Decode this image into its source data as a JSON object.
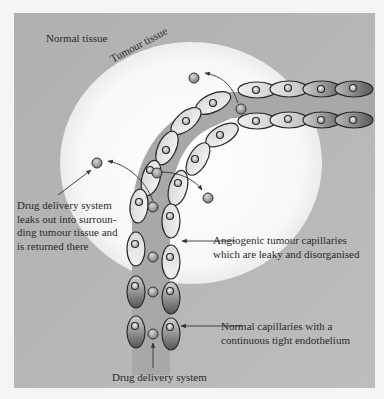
{
  "diagram": {
    "colors": {
      "page_background": "#f4f4f4",
      "normal_tissue": "#b3b3b3",
      "tumour_tissue": "#fafafa",
      "vessel_lumen": "#a9a9a9",
      "cell_outline": "#2b2b2b",
      "cell_fill_light": "#e6e6e6",
      "cell_fill_dark": "#6e6e6e",
      "particle": "#9a9a9a",
      "arrow": "#333333",
      "text": "#2a2a2a"
    },
    "regions": {
      "normal_tissue_label": "Normal tissue",
      "tumour_tissue_label": "Tumour tissue"
    },
    "annotations": {
      "leak": {
        "lines": [
          "Drug delivery system",
          "leaks out into surroun-",
          "ding tumour tissue and",
          "is returned there"
        ]
      },
      "angiogenic": {
        "lines": [
          "Angiogenic tumour capillaries",
          "which are leaky and disorganised"
        ]
      },
      "normal_capillaries": {
        "lines": [
          "Normal capillaries with a",
          "continuous tight endothelium"
        ]
      },
      "drug_delivery_system": {
        "lines": [
          "Drug delivery system"
        ]
      }
    },
    "icons": {
      "endothelial_cell": "ellipse-with-nucleus-icon",
      "drug_particle": "sphere-icon",
      "arrow": "arrow-icon"
    }
  }
}
